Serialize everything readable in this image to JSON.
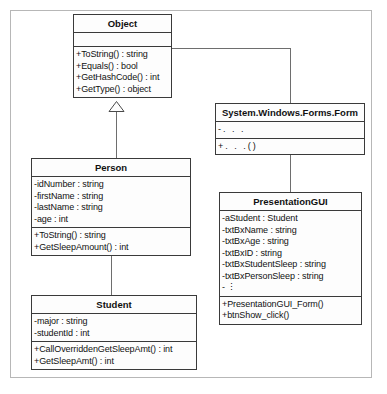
{
  "diagram": {
    "type": "uml-class-diagram",
    "classes": [
      {
        "id": "object",
        "name": "Object",
        "attributes": [],
        "operations": [
          "+ToString() : string",
          "+Equals() : bool",
          "+GetHashCode() : int",
          "+GetType() : object"
        ]
      },
      {
        "id": "form",
        "name": "System.Windows.Forms.Form",
        "attributes": [
          "-. . ."
        ],
        "operations": [
          "+. . .()"
        ]
      },
      {
        "id": "person",
        "name": "Person",
        "attributes": [
          "-idNumber : string",
          "-firstName : string",
          "-lastName : string",
          "-age : int"
        ],
        "operations": [
          "+ToString() : string",
          "+GetSleepAmount() : int"
        ]
      },
      {
        "id": "presentationgui",
        "name": "PresentationGUI",
        "attributes": [
          "-aStudent : Student",
          "-txtBxName : string",
          "-txtBxAge : string",
          "-txtBxID : string",
          "-txtBxStudentSleep : string",
          "-txtBxPersonSleep : string",
          "-      ⋮"
        ],
        "operations": [
          "+PresentationGUI_Form()",
          "+btnShow_click()"
        ]
      },
      {
        "id": "student",
        "name": "Student",
        "attributes": [
          "-major : string",
          "-studentId : int"
        ],
        "operations": [
          "+CallOverriddenGetSleepAmt() : int",
          "+GetSleepAmt() : int"
        ]
      }
    ],
    "relationships": [
      {
        "type": "generalization",
        "from": "person",
        "to": "object"
      },
      {
        "type": "generalization",
        "from": "student",
        "to": "person"
      },
      {
        "type": "generalization",
        "from": "form",
        "to": "object"
      },
      {
        "type": "generalization",
        "from": "presentationgui",
        "to": "form"
      }
    ]
  },
  "colors": {
    "border": "#3a3a3a",
    "connector": "#6e6e6e",
    "frame": "#b7b7b7",
    "background": "#ffffff",
    "box_fill": "#fdfdfd"
  }
}
